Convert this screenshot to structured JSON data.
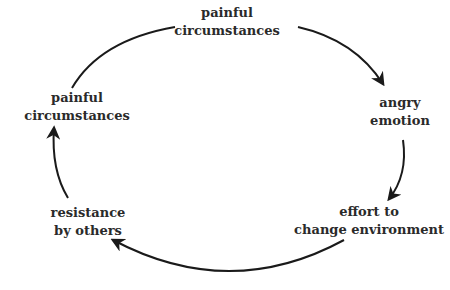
{
  "diagram": {
    "type": "cycle",
    "colors": {
      "text": "#2a2a2a",
      "arrow": "#1a1a1a",
      "background": "#ffffff"
    },
    "nodes": [
      {
        "id": "top",
        "line1": "painful",
        "line2": "circumstances"
      },
      {
        "id": "right",
        "line1": "angry",
        "line2": "emotion"
      },
      {
        "id": "bottom_right",
        "line1": "effort to",
        "line2": "change environment"
      },
      {
        "id": "bottom_left",
        "line1": "resistance",
        "line2": "by others"
      },
      {
        "id": "left",
        "line1": "painful",
        "line2": "circumstances"
      }
    ],
    "edges": [
      {
        "from": "top",
        "to": "right",
        "arrowhead": true
      },
      {
        "from": "right",
        "to": "bottom_right",
        "arrowhead": true
      },
      {
        "from": "bottom_right",
        "to": "bottom_left",
        "arrowhead": true
      },
      {
        "from": "bottom_left",
        "to": "left",
        "arrowhead": true
      },
      {
        "from": "left",
        "to": "top",
        "arrowhead": false
      }
    ]
  }
}
